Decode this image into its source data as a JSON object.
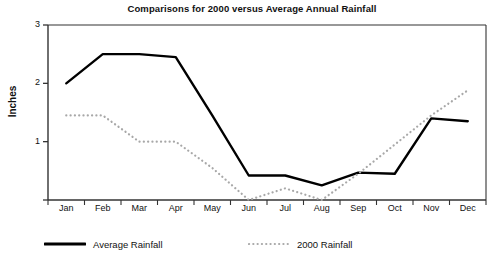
{
  "chart_data": {
    "type": "line",
    "title": "Comparisons for 2000 versus Average Annual Rainfall",
    "xlabel": "",
    "ylabel": "Inches",
    "categories": [
      "Jan",
      "Feb",
      "Mar",
      "Apr",
      "May",
      "Jun",
      "Jul",
      "Aug",
      "Sep",
      "Oct",
      "Nov",
      "Dec"
    ],
    "ylim": [
      0,
      3
    ],
    "yticks": [
      0,
      1,
      2,
      3
    ],
    "ytick_labels": [
      "",
      "1",
      "2",
      "3"
    ],
    "grid": false,
    "legend_position": "below",
    "series": [
      {
        "name": "Average Rainfall",
        "style": "solid",
        "color": "#000000",
        "values": [
          2.0,
          2.5,
          2.5,
          2.45,
          1.45,
          0.42,
          0.42,
          0.25,
          0.47,
          0.45,
          1.4,
          1.35
        ]
      },
      {
        "name": "2000 Rainfall",
        "style": "dotted",
        "color": "#a8a8a8",
        "values": [
          1.45,
          1.45,
          1.0,
          1.0,
          0.55,
          0.0,
          0.2,
          0.0,
          0.45,
          0.95,
          1.45,
          1.88
        ]
      }
    ]
  },
  "legend": {
    "items": [
      {
        "label": "Average Rainfall"
      },
      {
        "label": "2000 Rainfall"
      }
    ]
  },
  "colors": {
    "average_rainfall": "#000000",
    "rainfall_2000": "#a8a8a8",
    "axis": "#333333",
    "text": "#111111",
    "background": "#ffffff"
  }
}
